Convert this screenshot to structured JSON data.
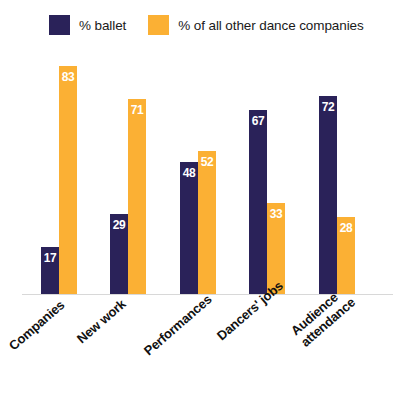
{
  "legend": {
    "items": [
      {
        "label": "% ballet",
        "color": "#2a2259",
        "swatch_name": "legend-swatch-ballet"
      },
      {
        "label": "% of all other dance companies",
        "color": "#fbb034",
        "swatch_name": "legend-swatch-other"
      }
    ]
  },
  "colors": {
    "ballet": "#2a2259",
    "other": "#fbb034",
    "axis": "#d8d8d8",
    "value_text": "#ffffff",
    "label_text": "#111111",
    "background": "#ffffff"
  },
  "chart_data": {
    "type": "bar",
    "title": "",
    "xlabel": "",
    "ylabel": "",
    "ylim": [
      0,
      90
    ],
    "grid": false,
    "legend_position": "top-left",
    "categories": [
      "Companies",
      "New work",
      "Performances",
      "Dancers' jobs",
      "Audience attendance"
    ],
    "category_lines": [
      [
        "Companies"
      ],
      [
        "New work"
      ],
      [
        "Performances"
      ],
      [
        "Dancers' jobs"
      ],
      [
        "Audience",
        "attendance"
      ]
    ],
    "series": [
      {
        "name": "% ballet",
        "color": "#2a2259",
        "values": [
          17,
          29,
          48,
          67,
          72
        ]
      },
      {
        "name": "% of all other dance companies",
        "color": "#fbb034",
        "values": [
          83,
          71,
          52,
          33,
          28
        ]
      }
    ]
  }
}
